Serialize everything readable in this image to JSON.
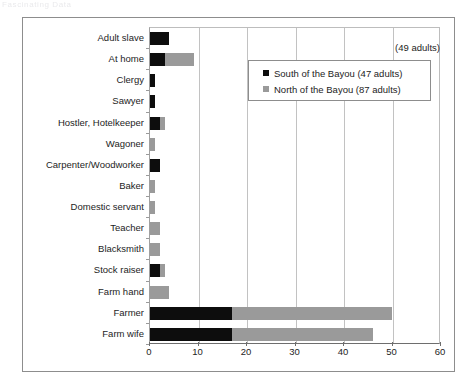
{
  "top_fragment": "Fascinating Data",
  "annotation": "(49 adults)",
  "legend": {
    "position": "inside-top-right",
    "entries": [
      {
        "label": "South of the Bayou (47 adults)",
        "color": "#0d0d0d",
        "swatch": "square-marker-icon"
      },
      {
        "label": "North of the Bayou (87 adults)",
        "color": "#9a9a9a",
        "swatch": "square-marker-icon"
      }
    ]
  },
  "chart_data": {
    "type": "bar",
    "orientation": "horizontal",
    "stacked": true,
    "title": "",
    "subtitle": "",
    "xlabel": "",
    "ylabel": "",
    "xlim": [
      0,
      60
    ],
    "xticks": [
      0,
      10,
      20,
      30,
      40,
      50,
      60
    ],
    "grid": "vertical",
    "legend_position": "inside-top-right",
    "annotations": [
      "(49 adults)"
    ],
    "categories": [
      "Adult slave",
      "At home",
      "Clergy",
      "Sawyer",
      "Hostler, Hotelkeeper",
      "Wagoner",
      "Carpenter/Woodworker",
      "Baker",
      "Domestic servant",
      "Teacher",
      "Blacksmith",
      "Stock raiser",
      "Farm hand",
      "Farmer",
      "Farm wife"
    ],
    "series": [
      {
        "name": "South of the Bayou (47 adults)",
        "color": "#0d0d0d",
        "values": [
          4,
          3,
          1,
          1,
          2,
          0,
          2,
          0,
          0,
          0,
          0,
          2,
          0,
          17,
          17
        ]
      },
      {
        "name": "North of the Bayou (87 adults)",
        "color": "#9a9a9a",
        "values": [
          0,
          6,
          0,
          0,
          1,
          1,
          0,
          1,
          1,
          2,
          2,
          1,
          4,
          33,
          29
        ]
      }
    ]
  }
}
